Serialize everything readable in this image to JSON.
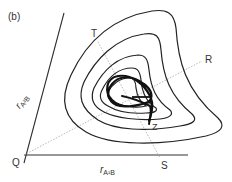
{
  "figure": {
    "panel_label": "(b)",
    "points": {
      "T": "T",
      "R": "R",
      "Z": "Z",
      "Q": "Q",
      "S": "S"
    },
    "axes": {
      "x_label_var": "r",
      "x_label_sub": "A¹B",
      "y_label_var": "r",
      "y_label_sub": "A²B"
    },
    "colors": {
      "line": "#222222",
      "dotted": "#b0b0b0",
      "trajectory": "#111111",
      "text": "#333333"
    },
    "contour_count": 5
  }
}
